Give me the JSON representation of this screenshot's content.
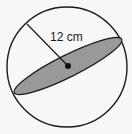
{
  "diagram": {
    "type": "sphere",
    "radius_label": "12 cm",
    "colors": {
      "background": "#f7f7f7",
      "outline": "#1a1a1a",
      "cross_section_fill": "#999999",
      "center_dot": "#111111"
    }
  }
}
